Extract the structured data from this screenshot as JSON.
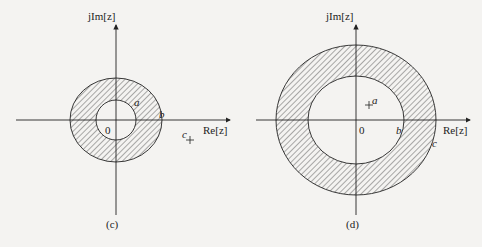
{
  "figures": [
    {
      "id": "c",
      "caption": "(c)",
      "y_axis_label": "jIm[z]",
      "x_axis_label": "Re[z]",
      "origin_label": "0",
      "points": [
        {
          "name": "a",
          "label": "a"
        },
        {
          "name": "b",
          "label": "b"
        },
        {
          "name": "c",
          "label": "c"
        }
      ],
      "region": "annulus: inner radius a, outer radius b (hatched)"
    },
    {
      "id": "d",
      "caption": "(d)",
      "y_axis_label": "jIm[z]",
      "x_axis_label": "Re[z]",
      "origin_label": "0",
      "points": [
        {
          "name": "a",
          "label": "a"
        },
        {
          "name": "b",
          "label": "b"
        },
        {
          "name": "c",
          "label": "c"
        }
      ],
      "region": "annulus: inner radius b, outer radius c (hatched)"
    }
  ]
}
